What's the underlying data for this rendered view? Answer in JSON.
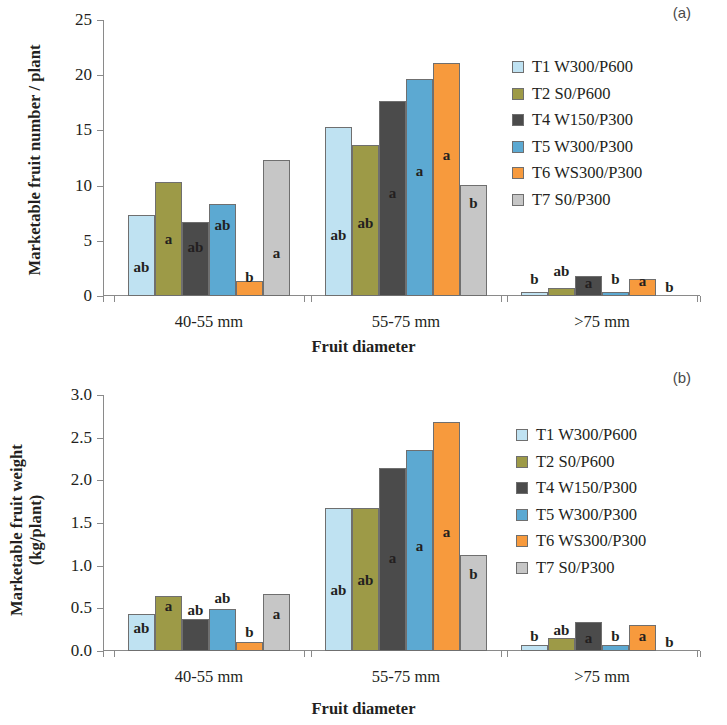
{
  "figure": {
    "panels": [
      {
        "tag": "(a)",
        "ytitle": "Marketable fruit number / plant",
        "ytitle_line2": "",
        "xtitle": "Fruit diameter"
      },
      {
        "tag": "(b)",
        "ytitle": "Marketable fruit weight",
        "ytitle_line2": "(kg/plant)",
        "xtitle": "Fruit diameter"
      }
    ]
  },
  "legend": {
    "items": [
      {
        "label": "T1 W300/P600",
        "color": "#bfe2f2"
      },
      {
        "label": "T2 S0/P600",
        "color": "#9d9a47"
      },
      {
        "label": "T4 W150/P300",
        "color": "#4b4b4b"
      },
      {
        "label": "T5 W300/P300",
        "color": "#5ca9d2"
      },
      {
        "label": "T6 WS300/P300",
        "color": "#f79a3d"
      },
      {
        "label": "T7 S0/P300",
        "color": "#c6c6c6"
      }
    ]
  },
  "chart_data": [
    {
      "type": "bar",
      "title": "(a)",
      "xlabel": "Fruit diameter",
      "ylabel": "Marketable fruit number / plant",
      "categories": [
        "40-55 mm",
        "55-75 mm",
        ">75 mm"
      ],
      "ylim": [
        0,
        25
      ],
      "yticks": [
        "0",
        "5",
        "10",
        "15",
        "20",
        "25"
      ],
      "ytick_values": [
        0,
        5,
        10,
        15,
        20,
        25
      ],
      "grid": false,
      "legend_position": "right",
      "series": [
        {
          "name": "T1 W300/P600",
          "color": "#bfe2f2",
          "values": [
            7.3,
            15.3,
            0.35
          ],
          "annotations": [
            "ab",
            "ab",
            "b"
          ]
        },
        {
          "name": "T2 S0/P600",
          "color": "#9d9a47",
          "values": [
            10.3,
            13.7,
            0.75
          ],
          "annotations": [
            "a",
            "ab",
            "ab"
          ]
        },
        {
          "name": "T4 W150/P300",
          "color": "#4b4b4b",
          "values": [
            6.7,
            17.7,
            1.8
          ],
          "annotations": [
            "ab",
            "a",
            "a"
          ]
        },
        {
          "name": "T5 W300/P300",
          "color": "#5ca9d2",
          "values": [
            8.3,
            19.7,
            0.35
          ],
          "annotations": [
            "ab",
            "a",
            "b"
          ]
        },
        {
          "name": "T6 WS300/P300",
          "color": "#f79a3d",
          "values": [
            1.4,
            21.1,
            1.5
          ],
          "annotations": [
            "b",
            "a",
            "a"
          ]
        },
        {
          "name": "T7 S0/P300",
          "color": "#c6c6c6",
          "values": [
            12.3,
            10.1,
            0.0
          ],
          "annotations": [
            "a",
            "b",
            "b"
          ]
        }
      ]
    },
    {
      "type": "bar",
      "title": "(b)",
      "xlabel": "Fruit diameter",
      "ylabel": "Marketable fruit weight (kg/plant)",
      "categories": [
        "40-55 mm",
        "55-75 mm",
        ">75 mm"
      ],
      "ylim": [
        0,
        3.0
      ],
      "yticks": [
        "0.0",
        "0.5",
        "1.0",
        "1.5",
        "2.0",
        "2.5",
        "3.0"
      ],
      "ytick_values": [
        0,
        0.5,
        1.0,
        1.5,
        2.0,
        2.5,
        3.0
      ],
      "grid": false,
      "legend_position": "right",
      "series": [
        {
          "name": "T1 W300/P600",
          "color": "#bfe2f2",
          "values": [
            0.43,
            1.68,
            0.07
          ],
          "annotations": [
            "ab",
            "ab",
            "b"
          ]
        },
        {
          "name": "T2 S0/P600",
          "color": "#9d9a47",
          "values": [
            0.65,
            1.68,
            0.15
          ],
          "annotations": [
            "a",
            "ab",
            "ab"
          ]
        },
        {
          "name": "T4 W150/P300",
          "color": "#4b4b4b",
          "values": [
            0.38,
            2.15,
            0.34
          ],
          "annotations": [
            "ab",
            "a",
            "a"
          ]
        },
        {
          "name": "T5 W300/P300",
          "color": "#5ca9d2",
          "values": [
            0.49,
            2.35,
            0.07
          ],
          "annotations": [
            "ab",
            "a",
            "b"
          ]
        },
        {
          "name": "T6 WS300/P300",
          "color": "#f79a3d",
          "values": [
            0.1,
            2.68,
            0.31
          ],
          "annotations": [
            "b",
            "a",
            "a"
          ]
        },
        {
          "name": "T7 S0/P300",
          "color": "#c6c6c6",
          "values": [
            0.67,
            1.13,
            0.0
          ],
          "annotations": [
            "a",
            "b",
            "b"
          ]
        }
      ]
    }
  ]
}
